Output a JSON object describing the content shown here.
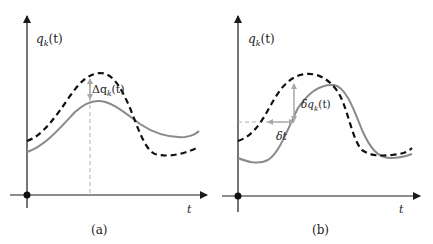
{
  "panels": [
    {
      "id": "a",
      "caption": "(a)",
      "y_label": "q_k(t)",
      "y_label_main": "q",
      "y_label_sub": "k",
      "y_label_arg": "(t)",
      "x_label": "t",
      "annotation": "Δq_k(t)",
      "annotation_main": "Δq",
      "annotation_sub": "k",
      "annotation_arg": "(t)"
    },
    {
      "id": "b",
      "caption": "(b)",
      "y_label": "q_k(t)",
      "y_label_main": "q",
      "y_label_sub": "k",
      "y_label_arg": "(t)",
      "x_label": "t",
      "annotation": "δq_k(t)",
      "annotation_main": "δq",
      "annotation_sub": "k",
      "annotation_arg": "(t)",
      "annotation2": "δt"
    }
  ],
  "colors": {
    "axis": "#1a1a1a",
    "dashed_curve": "#111111",
    "solid_curve": "#8a8a8a",
    "guide": "#b0b0b0"
  },
  "legend": {
    "solid_curve": "actual path",
    "dashed_curve": "varied path"
  }
}
